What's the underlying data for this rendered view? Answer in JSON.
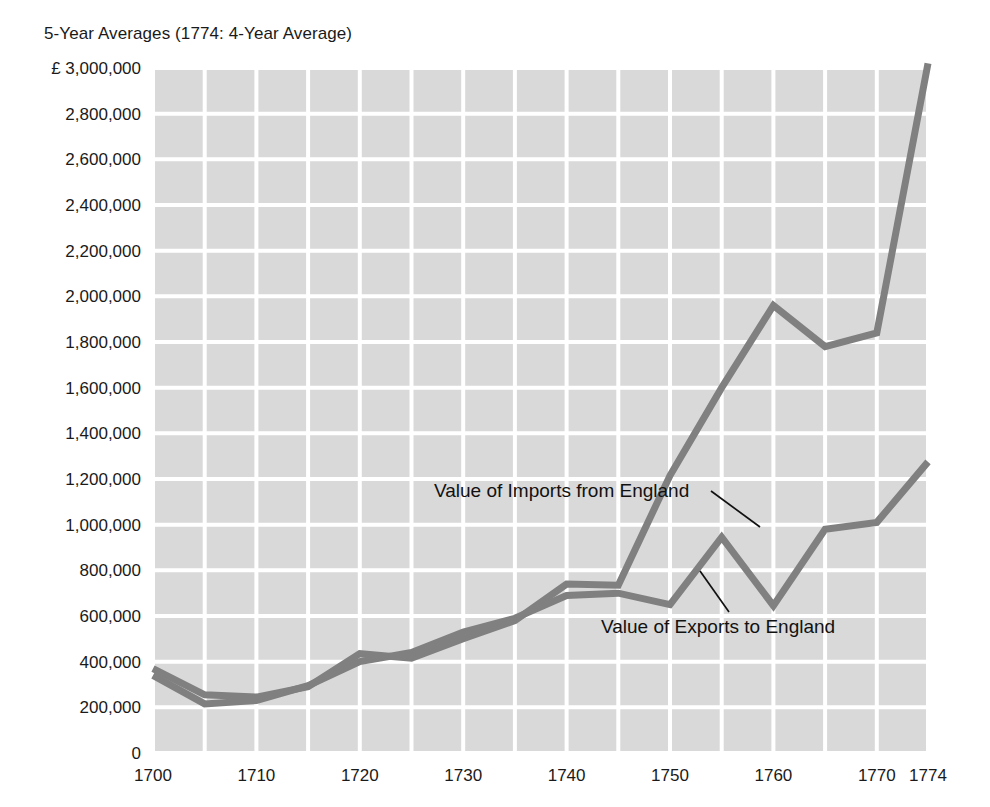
{
  "chart_data": {
    "type": "line",
    "title": "5-Year Averages (1774: 4-Year Average)",
    "xlabel": "",
    "ylabel": "",
    "currency_symbol": "£",
    "xlim": [
      1700,
      1774
    ],
    "ylim": [
      0,
      3000000
    ],
    "grid": true,
    "grid_color": "#ffffff",
    "plot_background": "#d9d9d9",
    "line_color": "#808080",
    "legend_position": "inline-annotations",
    "x": [
      1700,
      1705,
      1710,
      1715,
      1720,
      1725,
      1730,
      1735,
      1740,
      1745,
      1750,
      1755,
      1760,
      1765,
      1770,
      1774
    ],
    "xtick_labels": [
      "1700",
      "1710",
      "1720",
      "1730",
      "1740",
      "1750",
      "1760",
      "1770",
      "1774"
    ],
    "xtick_values": [
      1700,
      1710,
      1720,
      1730,
      1740,
      1750,
      1760,
      1770,
      1774
    ],
    "ytick_labels": [
      "£ 3,000,000",
      "2,800,000",
      "2,600,000",
      "2,400,000",
      "2,200,000",
      "2,000,000",
      "1,800,000",
      "1,600,000",
      "1,400,000",
      "1,200,000",
      "1,000,000",
      "800,000",
      "600,000",
      "400,000",
      "200,000",
      "0"
    ],
    "ytick_values": [
      3000000,
      2800000,
      2600000,
      2400000,
      2200000,
      2000000,
      1800000,
      1600000,
      1400000,
      1200000,
      1000000,
      800000,
      600000,
      400000,
      200000,
      0
    ],
    "series": [
      {
        "name": "Value of Imports from England",
        "annotation": "Value of Imports from England",
        "values": [
          370000,
          255000,
          245000,
          290000,
          435000,
          415000,
          500000,
          580000,
          740000,
          735000,
          1215000,
          1600000,
          1960000,
          1780000,
          1840000,
          3020000
        ]
      },
      {
        "name": "Value of Exports to England",
        "annotation": "Value of Exports to England",
        "values": [
          340000,
          215000,
          230000,
          295000,
          400000,
          440000,
          530000,
          590000,
          690000,
          700000,
          650000,
          945000,
          645000,
          980000,
          1010000,
          1275000
        ]
      }
    ]
  }
}
